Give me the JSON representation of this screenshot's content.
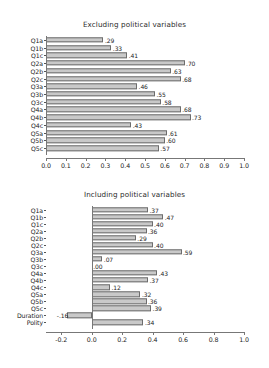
{
  "page": {
    "background": "#ffffff",
    "bar_fill": "#c9c9c9",
    "bar_edge": "#6d6d6d",
    "axis_color": "#777777",
    "text_color": "#1d1d1d"
  },
  "chart_data": [
    {
      "type": "bar",
      "orientation": "horizontal",
      "title": "Excluding political variables",
      "xlabel": "",
      "ylabel": "",
      "xlim": [
        0.0,
        1.0
      ],
      "xticks": [
        "0.0",
        "0.1",
        "0.2",
        "0.3",
        "0.4",
        "0.5",
        "0.6",
        "0.7",
        "0.8",
        "0.9",
        "1.0"
      ],
      "xtick_values": [
        0.0,
        0.1,
        0.2,
        0.3,
        0.4,
        0.5,
        0.6,
        0.7,
        0.8,
        0.9,
        1.0
      ],
      "grid": false,
      "legend": "none",
      "categories": [
        "Q1a",
        "Q1b",
        "Q1c",
        "Q2a",
        "Q2b",
        "Q2c",
        "Q3a",
        "Q3b",
        "Q3c",
        "Q4a",
        "Q4b",
        "Q4c",
        "Q5a",
        "Q5b",
        "Q5c"
      ],
      "values": [
        0.29,
        0.33,
        0.41,
        0.7,
        0.63,
        0.68,
        0.46,
        0.55,
        0.58,
        0.68,
        0.73,
        0.43,
        0.61,
        0.6,
        0.57
      ],
      "data_labels": [
        ".29",
        ".33",
        ".41",
        ".70",
        ".63",
        ".68",
        ".46",
        ".55",
        ".58",
        ".68",
        ".73",
        ".43",
        ".61",
        ".60",
        ".57"
      ]
    },
    {
      "type": "bar",
      "orientation": "horizontal",
      "title": "Including political variables",
      "xlabel": "",
      "ylabel": "",
      "xlim": [
        -0.3,
        1.0
      ],
      "xticks": [
        "-0.2",
        "0.0",
        "0.2",
        "0.4",
        "0.6",
        "0.8",
        "1.0"
      ],
      "xtick_values": [
        -0.2,
        0.0,
        0.2,
        0.4,
        0.6,
        0.8,
        1.0
      ],
      "grid": false,
      "legend": "none",
      "categories": [
        "Q1a",
        "Q1b",
        "Q1c",
        "Q2a",
        "Q2b",
        "Q2c",
        "Q3a",
        "Q3b",
        "Q3c",
        "Q4a",
        "Q4b",
        "Q4c",
        "Q5a",
        "Q5b",
        "Q5c",
        "Duration",
        "Polity"
      ],
      "values": [
        0.37,
        0.47,
        0.4,
        0.36,
        0.29,
        0.4,
        0.59,
        0.07,
        0.0,
        0.43,
        0.37,
        0.12,
        0.32,
        0.36,
        0.39,
        -0.16,
        0.34
      ],
      "data_labels": [
        ".37",
        ".47",
        ".40",
        ".36",
        ".29",
        ".40",
        ".59",
        ".07",
        ".00",
        ".43",
        ".37",
        ".12",
        ".32",
        ".36",
        ".39",
        "-.16",
        ".34"
      ]
    }
  ]
}
